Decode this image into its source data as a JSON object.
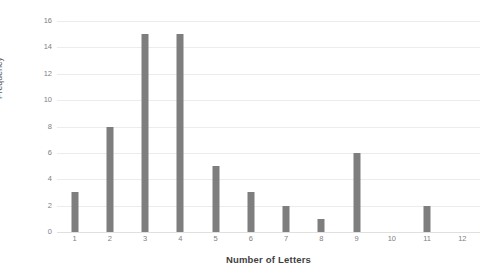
{
  "chart_data": {
    "type": "bar",
    "title": "",
    "xlabel": "Number of Letters",
    "ylabel": "Frequency",
    "categories": [
      "1",
      "2",
      "3",
      "4",
      "5",
      "6",
      "7",
      "8",
      "9",
      "10",
      "11",
      "12"
    ],
    "values": [
      3,
      8,
      15,
      15,
      5,
      3,
      2,
      1,
      6,
      0,
      2,
      0
    ],
    "ylim": [
      0,
      16
    ],
    "yticks": [
      0,
      2,
      4,
      6,
      8,
      10,
      12,
      14,
      16
    ],
    "xticks": [
      "1",
      "2",
      "3",
      "4",
      "5",
      "6",
      "7",
      "8",
      "9",
      "10",
      "11",
      "12"
    ],
    "grid": "horizontal",
    "legend": "none",
    "bar_color": "#7e7e7e",
    "gridline_color": "#ececec",
    "background_color": "#ffffff",
    "axis_label_color": "#808080",
    "axis_title_color": "#3f3f3f"
  }
}
